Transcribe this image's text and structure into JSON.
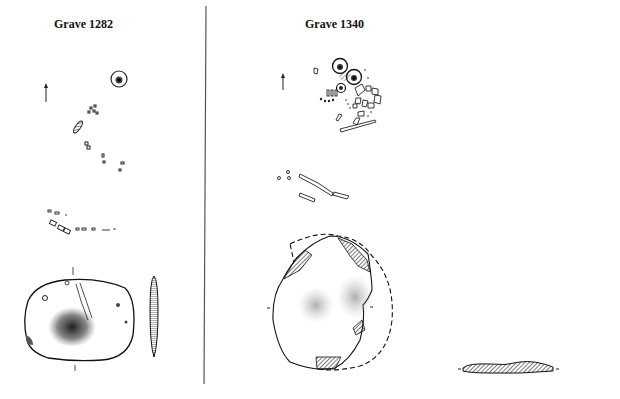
{
  "figure": {
    "panels": [
      {
        "title": "Grave 1282"
      },
      {
        "title": "Grave 1340"
      }
    ],
    "divider": "vertical-rule"
  }
}
